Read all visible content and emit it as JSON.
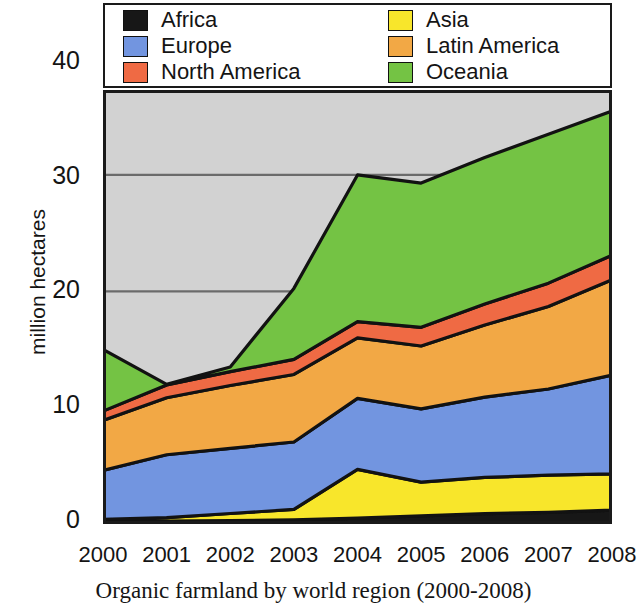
{
  "caption": "Organic farmland by world region (2000-2008)",
  "axes": {
    "ylabel": "million hectares",
    "yticks": [
      "0",
      "10",
      "20",
      "30",
      "40"
    ],
    "xlabel": ""
  },
  "legend": {
    "left_column": [
      {
        "label": "Africa",
        "color": "#171717"
      },
      {
        "label": "Europe",
        "color": "#7295e0"
      },
      {
        "label": "North America",
        "color": "#ef6a44"
      }
    ],
    "right_column": [
      {
        "label": "Asia",
        "color": "#f8e62b"
      },
      {
        "label": "Latin America",
        "color": "#f2a845"
      },
      {
        "label": "Oceania",
        "color": "#74c344"
      }
    ]
  },
  "chart_data": {
    "type": "area",
    "stacked": true,
    "title": "Organic farmland by world region (2000-2008)",
    "xlabel": "",
    "ylabel": "million hectares",
    "categories": [
      "2000",
      "2001",
      "2002",
      "2003",
      "2004",
      "2005",
      "2006",
      "2007",
      "2008"
    ],
    "x": [
      2000,
      2001,
      2002,
      2003,
      2004,
      2005,
      2006,
      2007,
      2008
    ],
    "ylim": [
      0,
      40
    ],
    "xlim": [
      2000,
      2008
    ],
    "grid": "horizontal",
    "gridlines": [
      20,
      30,
      40
    ],
    "legend_position": "above-plot",
    "plot_background": "#d2d2d2",
    "series": [
      {
        "name": "Africa",
        "color": "#171717",
        "values": [
          0.2,
          0.25,
          0.3,
          0.35,
          0.5,
          0.7,
          0.9,
          1.0,
          1.2
        ]
      },
      {
        "name": "Asia",
        "color": "#f8e62b",
        "values": [
          0.2,
          0.3,
          0.6,
          0.9,
          4.2,
          2.9,
          3.1,
          3.2,
          3.1
        ]
      },
      {
        "name": "Europe",
        "color": "#7295e0",
        "values": [
          4.2,
          5.4,
          5.6,
          5.8,
          6.1,
          6.3,
          6.9,
          7.4,
          8.5
        ]
      },
      {
        "name": "Latin America",
        "color": "#f2a845",
        "values": [
          4.3,
          4.9,
          5.4,
          5.8,
          5.2,
          5.4,
          6.2,
          7.1,
          8.2
        ]
      },
      {
        "name": "North America",
        "color": "#ef6a44",
        "values": [
          0.8,
          1.1,
          1.2,
          1.3,
          1.4,
          1.6,
          1.8,
          2.0,
          2.1
        ]
      },
      {
        "name": "Oceania",
        "color": "#74c344",
        "values": [
          5.3,
          0.05,
          0.4,
          6.1,
          12.6,
          12.4,
          12.6,
          12.8,
          12.4
        ]
      }
    ],
    "totals": [
      15.0,
      12.0,
      13.5,
      20.2,
      30.0,
      29.3,
      31.5,
      33.5,
      35.5
    ]
  }
}
